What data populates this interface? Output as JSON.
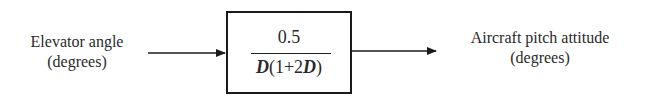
{
  "diagram": {
    "type": "block-diagram",
    "input": {
      "label_line1": "Elevator angle",
      "label_line2": "(degrees)"
    },
    "block": {
      "numerator": "0.5",
      "denominator_parts": [
        "D",
        "(1+2",
        "D",
        ")"
      ],
      "transfer_function": "0.5 / D(1+2D)"
    },
    "output": {
      "label_line1": "Aircraft pitch attitude",
      "label_line2": "(degrees)"
    }
  }
}
